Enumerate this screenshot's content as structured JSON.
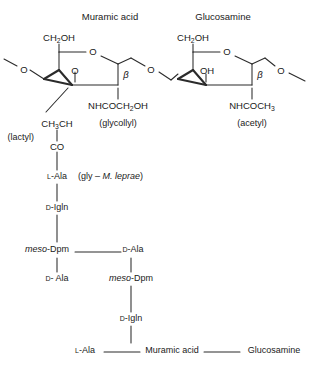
{
  "diagram": {
    "stroke_color": "#2b2b2b",
    "text_color": "#1a1a1a",
    "background": "#ffffff",
    "headers": {
      "muramic_acid": "Muramic acid",
      "glucosamine": "Glucosamine"
    },
    "sugar_left": {
      "name": "Muramic acid",
      "hydroxymethyl": "CH",
      "hydroxymethyl_sub": "2",
      "hydroxymethyl_tail": "OH",
      "ring_oxygen": "O",
      "ether_oxygen": "O",
      "glycosidic_oxygen": "O",
      "anomeric_label": "β",
      "n_acyl": "NHCOCH",
      "n_acyl_sub": "2",
      "n_acyl_tail": "OH",
      "n_acyl_name": "(glycollyl)"
    },
    "sugar_right": {
      "name": "Glucosamine",
      "hydroxymethyl": "CH",
      "hydroxymethyl_sub": "2",
      "hydroxymethyl_tail": "OH",
      "ring_oxygen": "O",
      "hydroxyl": "OH",
      "terminal_oxygen": "O",
      "anomeric_label": "β",
      "n_acyl": "NHCOCH",
      "n_acyl_sub": "3",
      "n_acyl_name": "(acetyl)"
    },
    "lactyl": {
      "formula_a": "CH",
      "formula_sub": "3",
      "formula_b": "CH",
      "name": "(lactyl)",
      "carbonyl": "CO"
    },
    "peptide_chain_1": [
      {
        "prefix": "L",
        "residue": "-Ala",
        "note": "(gly – M. leprae)",
        "note_italic": "M. leprae"
      },
      {
        "prefix": "D",
        "residue": "-Igln",
        "note": ""
      },
      {
        "prefix": "meso",
        "residue": "-Dpm",
        "note": "",
        "prefix_italic": true
      },
      {
        "prefix": "D",
        "residue": "- Ala",
        "note": ""
      }
    ],
    "peptide_chain_2": [
      {
        "prefix": "D",
        "residue": "-Ala",
        "note": ""
      },
      {
        "prefix": "meso",
        "residue": "-Dpm",
        "note": "",
        "prefix_italic": true
      },
      {
        "prefix": "D",
        "residue": "-Igln",
        "note": ""
      },
      {
        "prefix": "L",
        "residue": "-Ala",
        "note": ""
      }
    ],
    "bottom_row": {
      "residue_prefix": "L",
      "residue": "-Ala",
      "muramic_acid": "Muramic acid",
      "glucosamine": "Glucosamine"
    },
    "annotations": {
      "gly_note": "(gly – M. leprae)",
      "organism": "M. leprae"
    }
  }
}
